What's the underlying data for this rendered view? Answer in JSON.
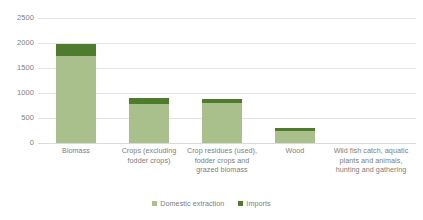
{
  "chart_data": {
    "type": "bar",
    "subtype": "stacked-column",
    "title": "",
    "xlabel": "",
    "ylabel": "",
    "ylim": [
      0,
      2500
    ],
    "yticks": [
      0,
      500,
      1000,
      1500,
      2000,
      2500
    ],
    "ytick_labels": [
      "0",
      "500",
      "1000",
      "1500",
      "2000",
      "2500"
    ],
    "grid": true,
    "legend_position": "bottom",
    "categories": [
      "Biomass",
      "Crops (excluding fodder crops)",
      "Crop residues (used), fodder crops and grazed biomass",
      "Wood",
      "Wild fish catch, aquatic plants and animals, hunting and gathering"
    ],
    "series": [
      {
        "name": "Domestic extraction",
        "color": "#A9C08C",
        "values": [
          1740,
          780,
          800,
          245,
          0
        ]
      },
      {
        "name": "Imports",
        "color": "#4F7B2E",
        "values": [
          240,
          120,
          75,
          55,
          0
        ]
      }
    ],
    "totals": [
      1980,
      900,
      875,
      300,
      0
    ]
  },
  "axis": {
    "y_ticks": [
      {
        "label": "2500",
        "value": 2500
      },
      {
        "label": "2000",
        "value": 2000
      },
      {
        "label": "1500",
        "value": 1500
      },
      {
        "label": "1000",
        "value": 1000
      },
      {
        "label": "500",
        "value": 500
      },
      {
        "label": "0",
        "value": 0
      }
    ],
    "x_categories": [
      {
        "label": "Biomass"
      },
      {
        "label": "Crops (excluding fodder crops)"
      },
      {
        "label": "Crop residues (used), fodder crops and grazed biomass"
      },
      {
        "label": "Wood"
      },
      {
        "label": "Wild fish catch, aquatic plants and animals, hunting and gathering"
      }
    ]
  },
  "legend": {
    "items": [
      {
        "label": "Domestic extraction",
        "color": "#A9C08C"
      },
      {
        "label": "Imports",
        "color": "#4F7B2E"
      }
    ]
  },
  "colors": {
    "domestic_extraction": "#A9C08C",
    "imports": "#4F7B2E",
    "gridline": "#e3e3e3",
    "text": "#7d7d7d",
    "background": "#ffffff"
  }
}
